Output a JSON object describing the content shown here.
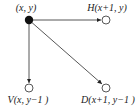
{
  "diagram": {
    "type": "grid-neighbor-graph",
    "colors": {
      "edge": "#444444",
      "node_filled": "#111111",
      "node_open_stroke": "#444444",
      "node_open_fill": "#ffffff",
      "text": "#1a1a1a"
    },
    "nodes": [
      {
        "id": "origin",
        "label": "(x, y)",
        "filled": true
      },
      {
        "id": "H",
        "label": "H(x+1, y)",
        "filled": false
      },
      {
        "id": "V",
        "label": "V(x, y−1 )",
        "filled": false
      },
      {
        "id": "D",
        "label": "D(x+1, y−1 )",
        "filled": false
      }
    ],
    "edges": [
      {
        "from": "origin",
        "to": "H",
        "direction": "horizontal"
      },
      {
        "from": "origin",
        "to": "V",
        "direction": "vertical"
      },
      {
        "from": "origin",
        "to": "D",
        "direction": "diagonal"
      }
    ]
  }
}
